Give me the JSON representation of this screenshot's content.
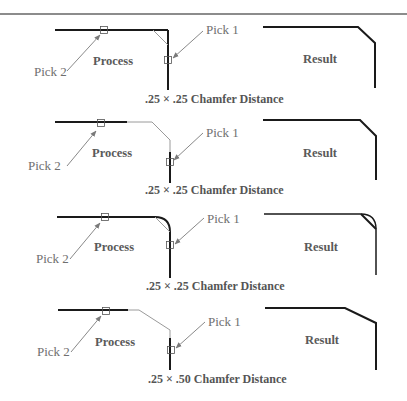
{
  "figure": {
    "colors": {
      "geometry": "#1a1a1a",
      "construction": "#9a9a9a",
      "leader": "#7a7a7a",
      "text": "#5a5a5a"
    },
    "panels": [
      {
        "stage_process": "Process",
        "stage_result": "Result",
        "pick1": "Pick 1",
        "pick2": "Pick 2",
        "caption": ".25 × .25 Chamfer Distance",
        "corner_type": "sharp-corner"
      },
      {
        "stage_process": "Process",
        "stage_result": "Result",
        "pick1": "Pick 1",
        "pick2": "Pick 2",
        "caption": ".25 × .25 Chamfer Distance",
        "corner_type": "open-gap-corner"
      },
      {
        "stage_process": "Process",
        "stage_result": "Result",
        "pick1": "Pick 1",
        "pick2": "Pick 2",
        "caption": ".25 × .25 Chamfer Distance",
        "corner_type": "filleted-corner"
      },
      {
        "stage_process": "Process",
        "stage_result": "Result",
        "pick1": "Pick 1",
        "pick2": "Pick 2",
        "caption": ".25 × .50 Chamfer Distance",
        "corner_type": "open-gap-corner"
      }
    ]
  }
}
